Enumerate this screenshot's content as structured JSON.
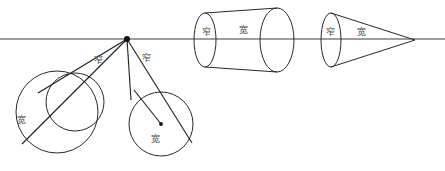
{
  "figure": {
    "canvas": {
      "width": 445,
      "height": 171
    },
    "colors": {
      "background": "#ffffff",
      "stroke": "#2a2a2a",
      "axis": "#3c3c3c",
      "ray": "#1e1e1e",
      "label_text": "#4a4a4a",
      "dot": "#111111"
    },
    "axis": {
      "name": "horizon-line",
      "y": 39,
      "x_start": 0,
      "x_end": 445
    },
    "vertex": {
      "name": "viewpoint",
      "x": 127,
      "y": 39,
      "radius": 3
    },
    "labels": {
      "narrow": "窄",
      "wide": "宽"
    },
    "label_positions": [
      {
        "id": "label-left-narrow-1",
        "text": "窄",
        "x": 98,
        "y": 60
      },
      {
        "id": "label-left-narrow-2",
        "text": "窄",
        "x": 146,
        "y": 58
      },
      {
        "id": "label-left-wide-1",
        "text": "宽",
        "x": 21,
        "y": 120
      },
      {
        "id": "label-left-wide-2",
        "text": "宽",
        "x": 155,
        "y": 139
      },
      {
        "id": "label-cylinder-narrow",
        "text": "窄",
        "x": 206,
        "y": 32
      },
      {
        "id": "label-cylinder-wide",
        "text": "宽",
        "x": 243,
        "y": 30
      },
      {
        "id": "label-cone-narrow",
        "text": "窄",
        "x": 330,
        "y": 32
      },
      {
        "id": "label-cone-wide",
        "text": "宽",
        "x": 361,
        "y": 32
      }
    ],
    "left_group": {
      "name": "tangent-circles-group",
      "big_circle": {
        "id": "left-big-circle",
        "cx": 57,
        "cy": 112,
        "r": 41
      },
      "small_circle": {
        "id": "left-small-circle",
        "cx": 75,
        "cy": 102,
        "r": 29
      },
      "lower_circle": {
        "id": "lower-right-circle",
        "cx": 161,
        "cy": 124,
        "r": 32
      },
      "lower_circle_center_dot": {
        "cx": 161,
        "cy": 124,
        "r": 2
      },
      "rays": [
        {
          "id": "ray-tangent-upper",
          "x1": 127,
          "y1": 39,
          "x2": 24,
          "y2": 142
        },
        {
          "id": "ray-tangent-top",
          "x1": 127,
          "y1": 39,
          "x2": 39,
          "y2": 92
        },
        {
          "id": "ray-to-lower-left",
          "x1": 127,
          "y1": 39,
          "x2": 131,
          "y2": 99
        },
        {
          "id": "ray-to-lower-right",
          "x1": 127,
          "y1": 39,
          "x2": 190,
          "y2": 140
        },
        {
          "id": "ray-radius",
          "x1": 134,
          "y1": 90,
          "x2": 161,
          "y2": 124
        }
      ]
    },
    "cylinder": {
      "name": "cylinder-solid",
      "left_ellipse": {
        "cx": 205,
        "cy": 40,
        "rx": 11,
        "ry": 27
      },
      "right_ellipse": {
        "cx": 277,
        "cy": 40,
        "rx": 17,
        "ry": 32
      },
      "top_edge": {
        "x1": 205,
        "y1": 13,
        "x2": 277,
        "y2": 8
      },
      "bottom_edge": {
        "x1": 205,
        "y1": 67,
        "x2": 277,
        "y2": 72
      }
    },
    "cone": {
      "name": "cone-solid",
      "base_ellipse": {
        "cx": 331,
        "cy": 40,
        "rx": 10,
        "ry": 27
      },
      "apex": {
        "x": 415,
        "y": 40
      },
      "upper_edge": {
        "x1": 331,
        "y1": 13,
        "x2": 415,
        "y2": 40
      },
      "lower_edge": {
        "x1": 331,
        "y1": 67,
        "x2": 415,
        "y2": 40
      }
    }
  }
}
